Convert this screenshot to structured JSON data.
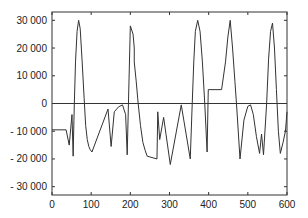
{
  "chart_data": {
    "type": "line",
    "title": "",
    "xlabel": "",
    "ylabel": "",
    "xlim": [
      0,
      600
    ],
    "ylim": [
      -33000,
      33000
    ],
    "grid": false,
    "legend": null,
    "x_ticks": [
      0,
      100,
      200,
      300,
      400,
      500,
      600
    ],
    "x_tick_labels": [
      "0",
      "100",
      "200",
      "300",
      "400",
      "500",
      "600"
    ],
    "y_ticks": [
      30000,
      20000,
      10000,
      0,
      -10000,
      -20000,
      -30000
    ],
    "y_tick_labels": [
      "30 000",
      "20 000",
      "10 000",
      "0",
      "- 10 000",
      "- 20 000",
      "- 30 000"
    ],
    "reference_lines": [
      {
        "axis": "y",
        "value": 0
      }
    ],
    "series": [
      {
        "name": "signal",
        "x": [
          0,
          36,
          44,
          51,
          54,
          56,
          57,
          60,
          64,
          68,
          72,
          77,
          82,
          86,
          90,
          94,
          97,
          102,
          143,
          151,
          159,
          170,
          180,
          188,
          192,
          200,
          207,
          210,
          210,
          215,
          220,
          226,
          232,
          238,
          243,
          268,
          270,
          275,
          285,
          302,
          330,
          353,
          358,
          362,
          366,
          372,
          378,
          384,
          390,
          396,
          399,
          401,
          401,
          433,
          443,
          449,
          455,
          461,
          467,
          471,
          480,
          490,
          500,
          507,
          514,
          522,
          530,
          535,
          540,
          548,
          553,
          558,
          563,
          568,
          573,
          578,
          583,
          590,
          596,
          600
        ],
        "y": [
          -9500,
          -9500,
          -15000,
          -4000,
          -19000,
          -6000,
          0,
          15000,
          26000,
          30000,
          27000,
          15000,
          2000,
          -8000,
          -13000,
          -15500,
          -16500,
          -17500,
          -2000,
          -15500,
          -3000,
          -1200,
          -500,
          -4000,
          -18500,
          28000,
          25000,
          20000,
          15000,
          8000,
          0,
          -8000,
          -14000,
          -17000,
          -19000,
          -20000,
          -3000,
          -13000,
          -5000,
          -22000,
          -500,
          -20000,
          0,
          15000,
          26000,
          30000,
          26000,
          15000,
          0,
          -17500,
          5000,
          5000,
          5000,
          5000,
          15000,
          24000,
          30000,
          20000,
          8000,
          0,
          -20000,
          -6000,
          -1000,
          -500,
          -4000,
          -12000,
          -18000,
          -11000,
          -18500,
          0,
          16000,
          26000,
          29000,
          20000,
          5000,
          -10000,
          -18000,
          -14000,
          -10000,
          -3000
        ]
      }
    ]
  }
}
